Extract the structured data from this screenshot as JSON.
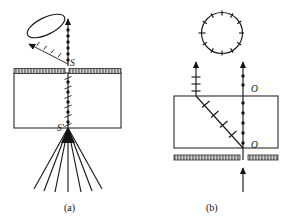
{
  "figure": {
    "title_hidden": "",
    "background_color": "#ffffff",
    "ink_color": "#141414",
    "panels": [
      {
        "id": "panel-a",
        "caption": "(a)",
        "caption_x": 71,
        "caption_y": 210,
        "labels": [
          {
            "name": "source-label-s",
            "text": "S",
            "x": 70,
            "y": 66
          },
          {
            "name": "image-label-s-prime",
            "text": "S'",
            "x": 58,
            "y": 131
          }
        ],
        "crystal_box": {
          "x": 14,
          "y": 73,
          "width": 107,
          "height": 55
        },
        "screen_bar": {
          "x": 14,
          "y": 68,
          "width": 107,
          "height": 5,
          "gap_x": 65,
          "gap_width": 3
        },
        "cone": {
          "name": "light-cone-ellipse",
          "cx": 46,
          "cy": 26,
          "rx": 20,
          "ry": 9,
          "rotation": -24
        },
        "ray_fan": {
          "name": "diverging-ray-fan",
          "apex_x": 68,
          "apex_y": 128,
          "count": 7,
          "length": 62,
          "spread_degrees": 54
        },
        "beaded_line": {
          "name": "ordinary-ray-beaded-line",
          "x": 68,
          "y_top": 30,
          "y_bottom": 128,
          "bead_count": 11
        }
      },
      {
        "id": "panel-b",
        "caption": "(b)",
        "caption_x": 212,
        "caption_y": 210,
        "labels": [
          {
            "name": "o-ray-label-top",
            "text": "O",
            "x": 252,
            "y": 92
          },
          {
            "name": "o-ray-label-bottom",
            "text": "O",
            "x": 252,
            "y": 148
          }
        ],
        "crystal_box": {
          "x": 174,
          "y": 96,
          "width": 104,
          "height": 52
        },
        "screen_bar": {
          "x": 174,
          "y": 155,
          "width": 104,
          "height": 5,
          "gap_x": 243,
          "gap_width": 6
        },
        "circle": {
          "name": "unpolarized-light-circle",
          "cx": 222,
          "cy": 33,
          "r": 21,
          "tick_count": 12
        },
        "e_ray": {
          "name": "extraordinary-ray",
          "x_top": 196,
          "y_top": 62,
          "x_bottom": 243,
          "y_bottom": 148,
          "tick_count": 4
        },
        "o_ray": {
          "name": "ordinary-ray",
          "x": 243,
          "y_top": 62,
          "y_bottom": 148,
          "bead_count": 6
        },
        "input_ray": {
          "name": "incident-beam-arrow",
          "x": 243,
          "y_start": 190,
          "y_end": 155
        }
      }
    ]
  }
}
